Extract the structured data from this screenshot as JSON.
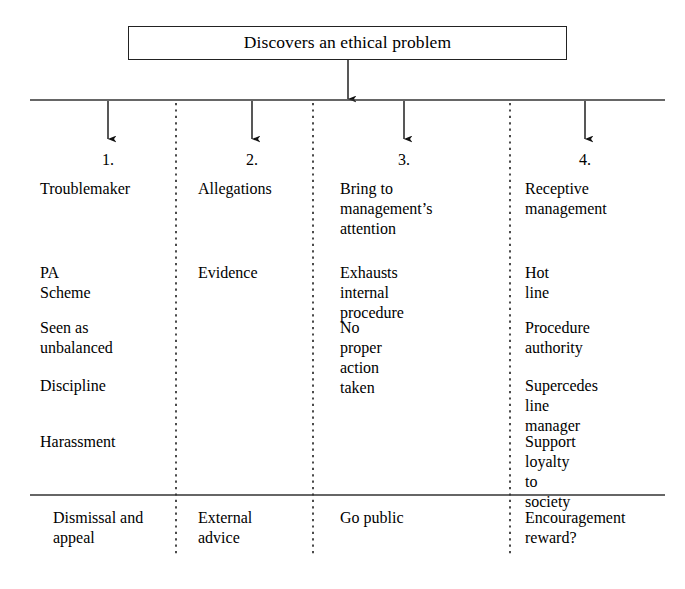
{
  "figure": {
    "header_box": {
      "label": "Discovers an ethical problem"
    },
    "columns": [
      {
        "number": "1.",
        "cells": [
          "Troublemaker",
          "PA Scheme",
          "Seen as\nunbalanced",
          "Discipline",
          "Harassment"
        ],
        "outcome": "Dismissal and\nappeal"
      },
      {
        "number": "2.",
        "cells": [
          "Allegations",
          "Evidence"
        ],
        "outcome": "External\nadvice"
      },
      {
        "number": "3.",
        "cells": [
          "Bring to\nmanagement’s\nattention",
          "Exhausts\ninternal procedure",
          "No proper action\ntaken"
        ],
        "outcome": "Go public"
      },
      {
        "number": "4.",
        "cells": [
          "Receptive\nmanagement",
          "Hot line",
          "Procedure\nauthority",
          "Supercedes\nline manager",
          "Support loyalty\nto society"
        ],
        "outcome": "Encouragement\nreward?"
      }
    ],
    "icons": {
      "source_arrow": "arrow-down-icon",
      "branch_arrow": "arrow-down-icon"
    },
    "colors": {
      "stroke": "#222222",
      "text": "#000000",
      "background": "#ffffff"
    }
  }
}
